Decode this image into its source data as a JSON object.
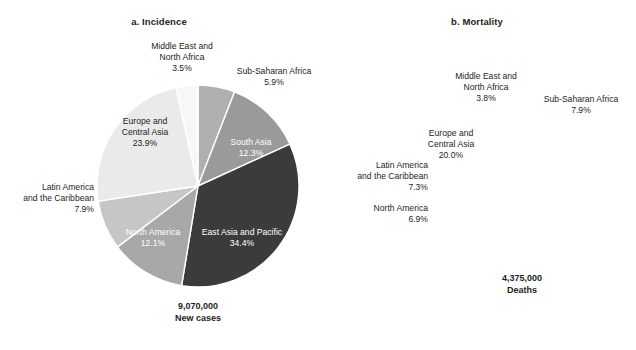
{
  "figure": {
    "background": "#ffffff",
    "text_color": "#231f20",
    "inside_label_color": "#ffffff"
  },
  "panels": [
    {
      "id": "a",
      "title": "a. Incidence",
      "total_value": "9,070,000",
      "total_unit": "New cases"
    },
    {
      "id": "b",
      "title": "b. Mortality",
      "total_value": "4,375,000",
      "total_unit": "Deaths"
    }
  ],
  "chart_data": [
    {
      "type": "pie",
      "title": "a. Incidence",
      "total_label": "9,070,000 New cases",
      "total_value": 9070000,
      "total_unit": "New cases",
      "start_angle_deg": 0,
      "direction": "clockwise",
      "categories": [
        "Sub-Saharan Africa",
        "South Asia",
        "East Asia and Pacific",
        "North America",
        "Latin America and the Caribbean",
        "Europe and Central Asia",
        "Middle East and North Africa"
      ],
      "values": [
        5.9,
        12.3,
        34.4,
        12.1,
        7.9,
        23.9,
        3.5
      ],
      "value_labels": [
        "5.9%",
        "12.3%",
        "34.4%",
        "12.1%",
        "7.9%",
        "23.9%",
        "3.5%"
      ],
      "colors": [
        "#b0b0b0",
        "#9a9a9a",
        "#3b3b3b",
        "#a8a8a8",
        "#c6c6c6",
        "#eaeaea",
        "#f7f7f7"
      ],
      "label_placement": [
        "outside",
        "inside",
        "inside",
        "inside",
        "outside",
        "inside",
        "outside"
      ],
      "legend": "none",
      "grid": false
    },
    {
      "type": "pie",
      "title": "b. Mortality",
      "total_label": "4,375,000 Deaths",
      "total_value": 4375000,
      "total_unit": "Deaths",
      "start_angle_deg": 0,
      "direction": "clockwise",
      "categories": [
        "Sub-Saharan Africa",
        "South Asia",
        "East Asia and Pacific",
        "North America",
        "Latin America and the Caribbean",
        "Europe and Central Asia",
        "Middle East and North Africa"
      ],
      "values": [
        7.9,
        16.1,
        38.1,
        6.9,
        7.3,
        20.0,
        3.8
      ],
      "value_labels": [
        "7.9%",
        "16.1%",
        "38.1%",
        "6.9%",
        "7.3%",
        "20.0%",
        "3.8%"
      ],
      "colors": [
        "#b0b0b0",
        "#9a9a9a",
        "#3b3b3b",
        "#a8a8a8",
        "#c6c6c6",
        "#eaeaea",
        "#f7f7f7"
      ],
      "label_placement": [
        "outside",
        "inside",
        "inside",
        "outside",
        "outside",
        "inside",
        "outside"
      ],
      "legend": "none",
      "grid": false
    }
  ],
  "labels_a": {
    "mena_name1": "Middle East and",
    "mena_name2": "North Africa",
    "mena_pct": "3.5%",
    "ssa_name": "Sub-Saharan Africa",
    "ssa_pct": "5.9%",
    "sa_name": "South Asia",
    "sa_pct": "12.3%",
    "eap_name": "East Asia and Pacific",
    "eap_pct": "34.4%",
    "na_name": "North America",
    "na_pct": "12.1%",
    "lac_name1": "Latin America",
    "lac_name2": "and the Caribbean",
    "lac_pct": "7.9%",
    "eca_name1": "Europe and",
    "eca_name2": "Central Asia",
    "eca_pct": "23.9%"
  },
  "labels_b": {
    "mena_name1": "Middle East and",
    "mena_name2": "North Africa",
    "mena_pct": "3.8%",
    "ssa_name": "Sub-Saharan Africa",
    "ssa_pct": "7.9%",
    "sa_name": "South Asia",
    "sa_pct": "16.1%",
    "eap_name": "East Asia and Pacific",
    "eap_pct": "38.1%",
    "na_name": "North America",
    "na_pct": "6.9%",
    "lac_name1": "Latin America",
    "lac_name2": "and the Caribbean",
    "lac_pct": "7.3%",
    "eca_name1": "Europe and",
    "eca_name2": "Central Asia",
    "eca_pct": "20.0%"
  }
}
